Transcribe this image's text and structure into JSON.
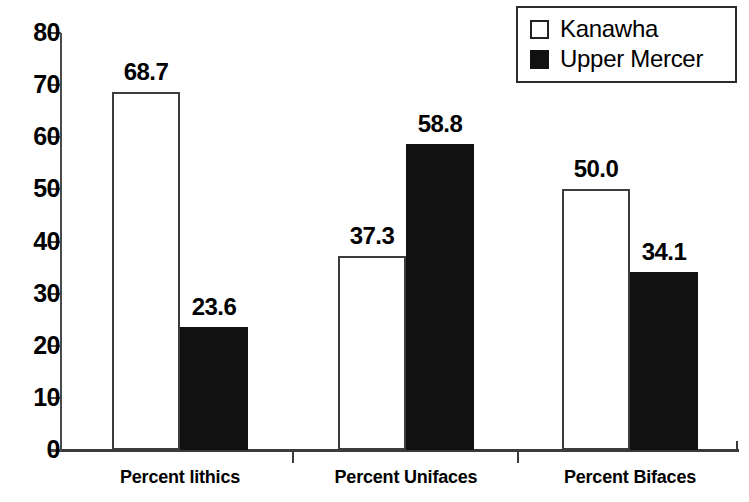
{
  "chart_data": {
    "type": "bar",
    "title": "",
    "subtitle": "",
    "xlabel": "",
    "ylabel": "",
    "categories": [
      "Percent lithics",
      "Percent Unifaces",
      "Percent Bifaces"
    ],
    "series": [
      {
        "name": "Kanawha",
        "swatch": "open-square",
        "color": "#ffffff",
        "border_color": "#3c3c3c",
        "values": [
          68.7,
          37.3,
          50.0
        ],
        "labels": [
          "68.7",
          "37.3",
          "50.0"
        ]
      },
      {
        "name": "Upper Mercer",
        "swatch": "filled-square",
        "color": "#111111",
        "border_color": "#111111",
        "values": [
          23.6,
          58.8,
          34.1
        ],
        "labels": [
          "23.6",
          "58.8",
          "34.1"
        ]
      }
    ],
    "ylim": [
      0,
      80
    ],
    "yticks": [
      0,
      10,
      20,
      30,
      40,
      50,
      60,
      70,
      80
    ],
    "ytick_labels": [
      "0",
      "10",
      "20",
      "30",
      "40",
      "50",
      "60",
      "70",
      "80"
    ],
    "grid": false,
    "legend_position": "top-right"
  },
  "legend": {
    "entries": [
      {
        "label": "Kanawha",
        "swatch": "open-square"
      },
      {
        "label": "Upper Mercer",
        "swatch": "filled-square"
      }
    ]
  },
  "axes": {
    "y_tick_labels": [
      "80",
      "70",
      "60",
      "50",
      "40",
      "30",
      "20",
      "10",
      "0"
    ],
    "x_tick_labels": [
      "Percent lithics",
      "Percent Unifaces",
      "Percent Bifaces"
    ]
  }
}
